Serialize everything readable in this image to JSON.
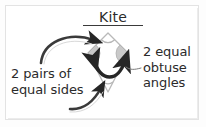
{
  "figure": {
    "title": "Kite",
    "background_color": "#ffffff",
    "border_color": "#e3e3e3",
    "ink_color": "#2b2b2b"
  },
  "annotations": {
    "left": {
      "line1": "2 pairs of",
      "line2": "equal sides"
    },
    "right": {
      "line1": "2 equal",
      "line2": "obtuse",
      "line3": "angles"
    }
  },
  "diagram": {
    "shape": "kite",
    "vertices": {
      "top": [
        108,
        33
      ],
      "left": [
        88,
        53
      ],
      "right": [
        128,
        53
      ],
      "bottom": [
        108,
        92
      ]
    },
    "outline_color": "#b9b9b9",
    "angle_marker_fill": "#c8c8c8",
    "arrow_color": "#262626"
  }
}
